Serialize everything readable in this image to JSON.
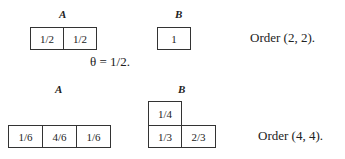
{
  "row1": {
    "label_a": "A",
    "label_b": "B",
    "a_cells": [
      "1/2",
      "1/2"
    ],
    "b_cells": [
      "1"
    ],
    "order": "Order (2, 2)."
  },
  "theta": "θ = 1/2.",
  "row2": {
    "label_a": "A",
    "label_b": "B",
    "a_cells": [
      "1/6",
      "4/6",
      "1/6"
    ],
    "b_top_cells": [
      "1/4"
    ],
    "b_bottom_cells": [
      "1/3",
      "2/3"
    ],
    "order": "Order (4, 4)."
  }
}
